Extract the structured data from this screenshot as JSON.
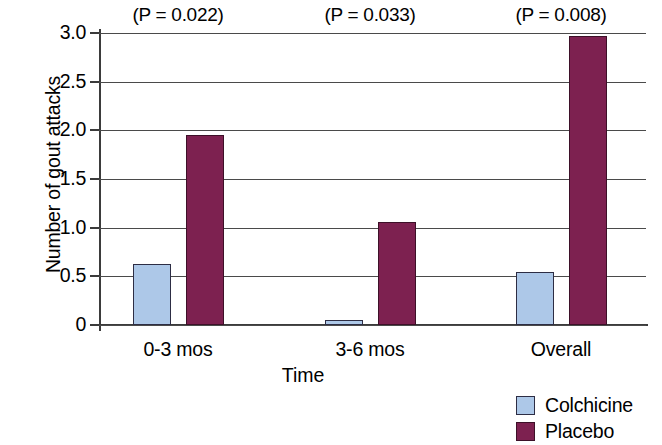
{
  "chart_data": {
    "type": "bar",
    "title": "",
    "xlabel": "Time",
    "ylabel": "Number of gout attacks",
    "categories": [
      "0-3 mos",
      "3-6 mos",
      "Overall"
    ],
    "series": [
      {
        "name": "Colchicine",
        "color": "#adc8e8",
        "values": [
          0.63,
          0.05,
          0.54
        ]
      },
      {
        "name": "Placebo",
        "color": "#7d2150",
        "values": [
          1.95,
          1.06,
          2.97
        ]
      }
    ],
    "ylim": [
      0,
      3.0
    ],
    "ytick_values": [
      0,
      0.5,
      1.0,
      1.5,
      2.0,
      2.5,
      3.0
    ],
    "ytick_labels": [
      "0",
      "0.5",
      "1.0",
      "1.5",
      "2.0",
      "2.5",
      "3.0"
    ],
    "grid": true,
    "legend_position": "bottom-right",
    "annotations": [
      {
        "text": "(P = 0.022)",
        "category": "0-3 mos"
      },
      {
        "text": "(P = 0.033)",
        "category": "3-6 mos"
      },
      {
        "text": "(P = 0.008)",
        "category": "Overall"
      }
    ]
  },
  "legend": {
    "items": [
      {
        "label": "Colchicine"
      },
      {
        "label": "Placebo"
      }
    ]
  }
}
